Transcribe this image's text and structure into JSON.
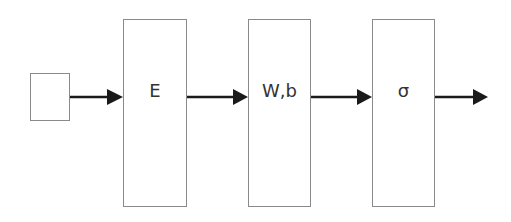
{
  "diagram": {
    "type": "flowchart",
    "direction": "left-to-right",
    "nodes": [
      {
        "id": "input",
        "label": ""
      },
      {
        "id": "embedding",
        "label": "E"
      },
      {
        "id": "linear",
        "label": "W,b"
      },
      {
        "id": "activation",
        "label": "σ"
      }
    ],
    "edges": [
      {
        "from": "input",
        "to": "embedding"
      },
      {
        "from": "embedding",
        "to": "linear"
      },
      {
        "from": "linear",
        "to": "activation"
      },
      {
        "from": "activation",
        "to": "output"
      }
    ],
    "colors": {
      "box_border": "#8a8a8a",
      "arrow": "#1a1a1a",
      "text": "#333333",
      "background": "#ffffff"
    }
  }
}
